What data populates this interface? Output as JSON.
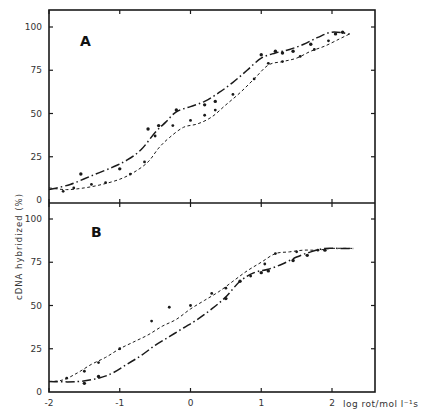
{
  "chart_data": [
    {
      "type": "line",
      "panel": "A",
      "title": "A",
      "xlabel": "log rot/mol l-1 s",
      "ylabel": "cDNA hybridized (%)",
      "xlim": [
        -2,
        2.5
      ],
      "ylim": [
        0,
        100
      ],
      "xticks": [
        -2,
        -1,
        0,
        1,
        2
      ],
      "yticks": [
        0,
        25,
        50,
        75,
        100
      ],
      "grid": false,
      "legend": null,
      "series": [
        {
          "name": "solid / dash-dot curve",
          "style": "solid-dashdot",
          "x": [
            -2.0,
            -1.7,
            -1.4,
            -1.1,
            -0.9,
            -0.7,
            -0.5,
            -0.35,
            -0.2,
            0.0,
            0.2,
            0.4,
            0.6,
            0.8,
            1.0,
            1.2,
            1.4,
            1.6,
            1.8,
            2.0,
            2.25
          ],
          "y": [
            6,
            9,
            14,
            19,
            23,
            29,
            39,
            45,
            51,
            54,
            57,
            62,
            68,
            75,
            82,
            85,
            87,
            90,
            94,
            97,
            96
          ]
        },
        {
          "name": "dashed curve",
          "style": "dashed",
          "x": [
            -2.0,
            -1.75,
            -1.5,
            -1.25,
            -1.0,
            -0.8,
            -0.6,
            -0.45,
            -0.3,
            -0.1,
            0.1,
            0.3,
            0.5,
            0.7,
            0.9,
            1.1,
            1.3,
            1.5,
            1.7,
            1.9,
            2.1,
            2.25
          ],
          "y": [
            7,
            6,
            7,
            9,
            12,
            16,
            22,
            30,
            36,
            42,
            44,
            48,
            55,
            62,
            70,
            78,
            80,
            82,
            86,
            89,
            93,
            96
          ]
        }
      ],
      "markers": {
        "solid": {
          "x": [
            -1.55,
            -1.0,
            -0.6,
            -0.45,
            -0.2,
            0.2,
            0.35,
            1.0,
            1.2,
            1.3,
            1.45,
            1.7,
            2.05,
            2.15
          ],
          "y": [
            15,
            18,
            41,
            43,
            52,
            55,
            57,
            84,
            86,
            85,
            86,
            90,
            96,
            97
          ]
        },
        "dashed": {
          "x": [
            -1.8,
            -1.65,
            -1.4,
            -1.2,
            -0.85,
            -0.65,
            -0.5,
            -0.25,
            0.0,
            0.2,
            0.35,
            0.6,
            0.9,
            1.1,
            1.3,
            1.55,
            1.75,
            1.95
          ],
          "y": [
            5,
            7,
            9,
            10,
            15,
            22,
            37,
            43,
            46,
            49,
            52,
            61,
            70,
            79,
            80,
            83,
            87,
            92
          ]
        }
      }
    },
    {
      "type": "line",
      "panel": "B",
      "title": "B",
      "xlabel": "log rot/mol l-1 s",
      "ylabel": "cDNA hybridized (%)",
      "xlim": [
        -2,
        2.5
      ],
      "ylim": [
        0,
        100
      ],
      "xticks": [
        -2,
        -1,
        0,
        1,
        2
      ],
      "yticks": [
        0,
        25,
        50,
        75,
        100
      ],
      "grid": false,
      "legend": null,
      "series": [
        {
          "name": "dashed curve",
          "style": "dashed",
          "x": [
            -2.0,
            -1.8,
            -1.6,
            -1.4,
            -1.2,
            -1.0,
            -0.8,
            -0.6,
            -0.4,
            -0.2,
            0.0,
            0.2,
            0.4,
            0.6,
            0.8,
            1.0,
            1.2,
            1.4,
            1.6,
            1.8,
            2.0,
            2.3
          ],
          "y": [
            6,
            7,
            11,
            16,
            20,
            25,
            29,
            33,
            38,
            42,
            48,
            53,
            58,
            64,
            70,
            75,
            80,
            81,
            82,
            82,
            83,
            83
          ]
        },
        {
          "name": "solid / dash-dot curve",
          "style": "solid-dashdot",
          "x": [
            -2.0,
            -1.6,
            -1.3,
            -1.1,
            -0.9,
            -0.7,
            -0.5,
            -0.3,
            -0.1,
            0.1,
            0.3,
            0.5,
            0.7,
            0.9,
            1.1,
            1.3,
            1.5,
            1.7,
            1.9,
            2.1,
            2.3
          ],
          "y": [
            6,
            6,
            8,
            11,
            16,
            21,
            27,
            32,
            37,
            42,
            48,
            55,
            64,
            69,
            71,
            74,
            78,
            81,
            83,
            83,
            83
          ]
        }
      ],
      "markers": {
        "dashed": {
          "x": [
            -1.75,
            -1.5,
            -1.3,
            -1.0,
            -0.55,
            -0.3,
            0.0,
            0.3,
            0.5,
            0.85,
            1.05,
            1.2,
            1.5,
            1.8
          ],
          "y": [
            8,
            12,
            17,
            25,
            41,
            49,
            50,
            57,
            60,
            67,
            74,
            80,
            81,
            82
          ]
        },
        "solid": {
          "x": [
            -1.5,
            -1.3,
            0.5,
            0.7,
            1.0,
            1.1,
            1.45,
            1.65,
            1.9
          ],
          "y": [
            5,
            9,
            54,
            64,
            69,
            70,
            76,
            79,
            82
          ]
        }
      }
    }
  ],
  "figure": {
    "panel_labels": [
      "A",
      "B"
    ],
    "y_axis_title": "cDNA hybridized (%)",
    "x_axis_title": "log rot/mol l⁻¹s",
    "x_tick_labels": [
      "-2",
      "-1",
      "0",
      "1",
      "2"
    ],
    "y_tick_labels": [
      "0",
      "25",
      "50",
      "75",
      "100"
    ]
  }
}
